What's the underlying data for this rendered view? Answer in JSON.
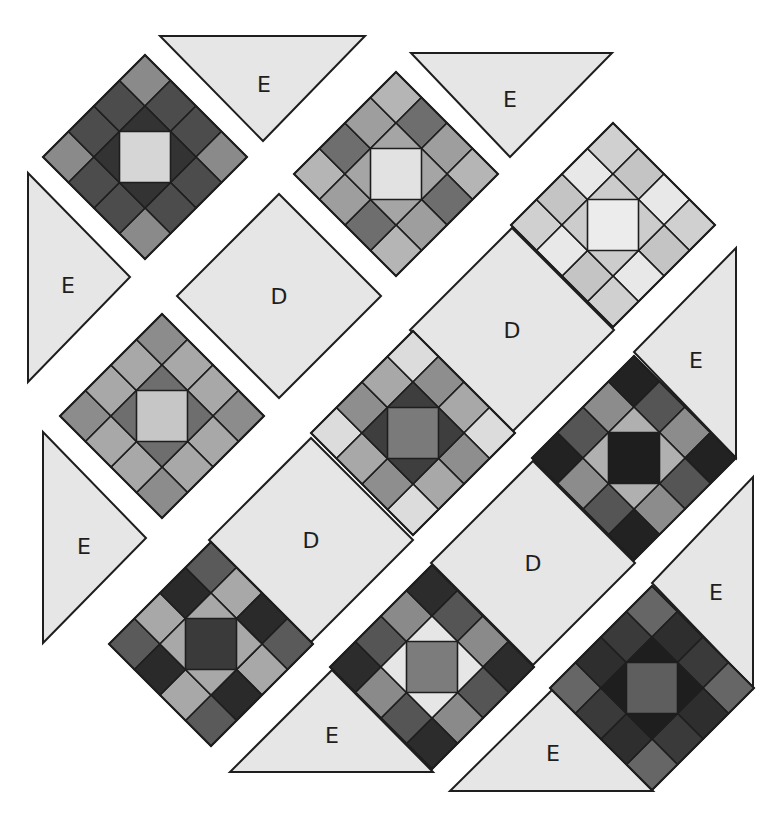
{
  "diagram": {
    "colors": {
      "background": "#ffffff",
      "setting_fill": "#e6e6e6",
      "outline": "#1e1e1e",
      "label": "#1e1e1e"
    },
    "block_half_diagonal": 102,
    "blocks": [
      {
        "id": "block-1",
        "row": 1,
        "center": [
          145,
          157
        ],
        "tip": "#8a8a8a",
        "edges": [
          "#4c4c4c",
          "#4c4c4c",
          "#4c4c4c",
          "#4c4c4c",
          "#4c4c4c",
          "#4c4c4c",
          "#4c4c4c",
          "#4c4c4c"
        ],
        "triangle": "#333333",
        "square": "#d6d6d6"
      },
      {
        "id": "block-2",
        "row": 2,
        "center": [
          396,
          174
        ],
        "tip": "#b5b5b5",
        "edges": [
          "#6e6e6e",
          "#9e9e9e",
          "#6e6e6e",
          "#9e9e9e",
          "#6e6e6e",
          "#9e9e9e",
          "#6e6e6e",
          "#9e9e9e"
        ],
        "triangle": "#a5a5a5",
        "square": "#e2e2e2"
      },
      {
        "id": "block-3",
        "row": 3,
        "center": [
          613,
          225
        ],
        "tip": "#d0d0d0",
        "edges": [
          "#c4c4c4",
          "#e8e8e8",
          "#c4c4c4",
          "#e8e8e8",
          "#c4c4c4",
          "#e8e8e8",
          "#c4c4c4",
          "#e8e8e8"
        ],
        "triangle": "#cccccc",
        "square": "#ececec"
      },
      {
        "id": "block-4",
        "row": 2,
        "center": [
          162,
          416
        ],
        "tip": "#8c8c8c",
        "edges": [
          "#a8a8a8",
          "#a8a8a8",
          "#a8a8a8",
          "#a8a8a8",
          "#a8a8a8",
          "#a8a8a8",
          "#a8a8a8",
          "#a8a8a8"
        ],
        "triangle": "#6e6e6e",
        "square": "#c6c6c6"
      },
      {
        "id": "block-5",
        "row": 3,
        "center": [
          413,
          433
        ],
        "tip": "#dcdcdc",
        "edges": [
          "#8e8e8e",
          "#a8a8a8",
          "#8e8e8e",
          "#a8a8a8",
          "#8e8e8e",
          "#a8a8a8",
          "#8e8e8e",
          "#a8a8a8"
        ],
        "triangle": "#3e3e3e",
        "square": "#7a7a7a"
      },
      {
        "id": "block-6",
        "row": 3,
        "center": [
          211,
          644
        ],
        "tip": "#5a5a5a",
        "edges": [
          "#a8a8a8",
          "#2a2a2a",
          "#a8a8a8",
          "#2a2a2a",
          "#a8a8a8",
          "#2a2a2a",
          "#a8a8a8",
          "#2a2a2a"
        ],
        "triangle": "#a8a8a8",
        "square": "#3a3a3a"
      },
      {
        "id": "block-7",
        "row": 4,
        "center": [
          432,
          667
        ],
        "tip": "#2c2c2c",
        "edges": [
          "#555555",
          "#8a8a8a",
          "#555555",
          "#8a8a8a",
          "#555555",
          "#8a8a8a",
          "#555555",
          "#8a8a8a"
        ],
        "triangle": "#e6e6e6",
        "square": "#7c7c7c"
      },
      {
        "id": "block-8",
        "row": 4,
        "center": [
          634,
          458
        ],
        "tip": "#222222",
        "edges": [
          "#555555",
          "#8c8c8c",
          "#555555",
          "#8c8c8c",
          "#555555",
          "#8c8c8c",
          "#555555",
          "#8c8c8c"
        ],
        "triangle": "#b0b0b0",
        "square": "#1e1e1e"
      },
      {
        "id": "block-9",
        "row": 5,
        "center": [
          652,
          688
        ],
        "tip": "#666666",
        "edges": [
          "#2e2e2e",
          "#3a3a3a",
          "#2e2e2e",
          "#3a3a3a",
          "#2e2e2e",
          "#3a3a3a",
          "#2e2e2e",
          "#3a3a3a"
        ],
        "triangle": "#1e1e1e",
        "square": "#5e5e5e"
      }
    ],
    "setting_squares": [
      {
        "id": "d-1",
        "label": "D",
        "row": 2,
        "center": [
          279,
          296
        ]
      },
      {
        "id": "d-2",
        "label": "D",
        "row": 3,
        "center": [
          512,
          330
        ]
      },
      {
        "id": "d-3",
        "label": "D",
        "row": 3,
        "center": [
          311,
          540
        ]
      },
      {
        "id": "d-4",
        "label": "D",
        "row": 4,
        "center": [
          533,
          563
        ]
      }
    ],
    "setting_triangles": [
      {
        "id": "e-1",
        "label": "E",
        "row": 1,
        "points": [
          [
            160,
            36
          ],
          [
            365,
            36
          ],
          [
            263,
            141
          ]
        ],
        "label_pos": [
          264,
          84
        ]
      },
      {
        "id": "e-2",
        "label": "E",
        "row": 2,
        "points": [
          [
            411,
            53
          ],
          [
            612,
            53
          ],
          [
            510,
            157
          ]
        ],
        "label_pos": [
          510,
          99
        ]
      },
      {
        "id": "e-3",
        "label": "E",
        "row": 1,
        "points": [
          [
            28,
            173
          ],
          [
            28,
            382
          ],
          [
            130,
            277
          ]
        ],
        "label_pos": [
          68,
          285
        ]
      },
      {
        "id": "e-4",
        "label": "E",
        "row": 2,
        "points": [
          [
            43,
            432
          ],
          [
            43,
            643
          ],
          [
            146,
            538
          ]
        ],
        "label_pos": [
          84,
          546
        ]
      },
      {
        "id": "e-5",
        "label": "E",
        "row": 4,
        "points": [
          [
            736,
            248
          ],
          [
            736,
            458
          ],
          [
            634,
            352
          ]
        ],
        "label_pos": [
          696,
          360
        ]
      },
      {
        "id": "e-6",
        "label": "E",
        "row": 5,
        "points": [
          [
            753,
            477
          ],
          [
            753,
            688
          ],
          [
            652,
            583
          ]
        ],
        "label_pos": [
          716,
          592
        ]
      },
      {
        "id": "e-7",
        "label": "E",
        "row": 4,
        "points": [
          [
            230,
            772
          ],
          [
            433,
            772
          ],
          [
            332,
            670
          ]
        ],
        "label_pos": [
          332,
          735
        ]
      },
      {
        "id": "e-8",
        "label": "E",
        "row": 5,
        "points": [
          [
            450,
            791
          ],
          [
            653,
            791
          ],
          [
            552,
            690
          ]
        ],
        "label_pos": [
          553,
          753
        ]
      }
    ]
  }
}
